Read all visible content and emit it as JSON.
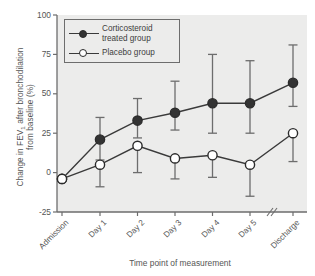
{
  "chart_data": {
    "type": "line",
    "title": "",
    "xlabel": "Time point of measurement",
    "ylabel_line1": "Change in FEV",
    "ylabel_sub": "1",
    "ylabel_line1b": " after bronchodilation",
    "ylabel_line2": "from baseline (%)",
    "ylabel_full": "Change in FEV1 after bronchodilation from baseline (%)",
    "categories": [
      "Admission",
      "Day 1",
      "Day 2",
      "Day 3",
      "Day 4",
      "Day 5",
      "Discharge"
    ],
    "ylim": [
      -25,
      100
    ],
    "yticks": [
      100,
      75,
      50,
      25,
      0,
      -25
    ],
    "ytick_labels": [
      "100",
      "75",
      "50",
      "25",
      "0",
      "-25"
    ],
    "grid": false,
    "axis_break_between": [
      "Day 5",
      "Discharge"
    ],
    "legend_position": "top-left",
    "series": [
      {
        "name": "Corticosteroid treated group",
        "marker": "filled-circle",
        "color": "#333333",
        "values": [
          -4,
          21,
          33,
          38,
          44,
          44,
          57
        ],
        "err_low": [
          -4,
          8,
          22,
          27,
          25,
          25,
          42
        ],
        "err_high": [
          -4,
          35,
          47,
          58,
          75,
          71,
          81
        ]
      },
      {
        "name": "Placebo group",
        "marker": "open-circle",
        "color": "#ffffff",
        "values": [
          -4,
          5,
          17,
          9,
          11,
          5,
          25
        ],
        "err_low": [
          -4,
          -9,
          0,
          -4,
          -3,
          -15,
          7
        ],
        "err_high": [
          -4,
          5,
          17,
          9,
          11,
          5,
          25
        ]
      }
    ]
  },
  "legend": {
    "items": [
      {
        "label_line1": "Corticosteroid",
        "label_line2": "treated group",
        "marker": "filled-circle"
      },
      {
        "label_line1": "Placebo group",
        "label_line2": "",
        "marker": "open-circle"
      }
    ]
  },
  "colors": {
    "plot_background": "#ececeb",
    "page_background": "#ffffff",
    "axis": "#6d6d6d",
    "series_filled": "#333333",
    "series_open": "#ffffff",
    "text": "#555555"
  }
}
